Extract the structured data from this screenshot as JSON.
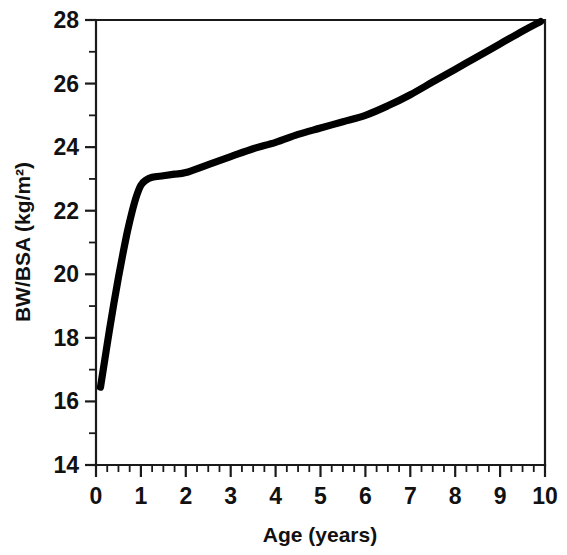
{
  "chart_data": {
    "type": "line",
    "title": "",
    "xlabel": "Age (years)",
    "ylabel": "BW/BSA (kg/m2)",
    "ylabel_display": "BW/BSA (kg/m²)",
    "xlim": [
      0,
      10
    ],
    "ylim": [
      14,
      28
    ],
    "xticks": [
      0,
      1,
      2,
      3,
      4,
      5,
      6,
      7,
      8,
      9,
      10
    ],
    "xtick_labels": [
      "0",
      "1",
      "2",
      "3",
      "4",
      "5",
      "6",
      "7",
      "8",
      "9",
      "10"
    ],
    "yticks": [
      14,
      16,
      18,
      20,
      22,
      24,
      26,
      28
    ],
    "ytick_labels": [
      "14",
      "16",
      "18",
      "20",
      "22",
      "24",
      "26",
      "28"
    ],
    "x_minor_interval": 0.25,
    "y_minor_interval": 1,
    "grid": false,
    "legend": false,
    "series": [
      {
        "name": "BW/BSA vs Age",
        "color": "#000000",
        "x": [
          0.1,
          0.2,
          0.3,
          0.4,
          0.5,
          0.6,
          0.7,
          0.8,
          0.9,
          1.0,
          1.1,
          1.25,
          1.5,
          1.75,
          2.0,
          2.5,
          3.0,
          3.5,
          4.0,
          4.5,
          5.0,
          5.5,
          6.0,
          6.5,
          7.0,
          7.5,
          8.0,
          8.5,
          9.0,
          9.5,
          9.9
        ],
        "y": [
          16.45,
          17.35,
          18.25,
          19.1,
          19.9,
          20.65,
          21.35,
          21.95,
          22.45,
          22.8,
          22.95,
          23.05,
          23.1,
          23.15,
          23.2,
          23.45,
          23.7,
          23.95,
          24.15,
          24.4,
          24.6,
          24.8,
          25.0,
          25.3,
          25.65,
          26.05,
          26.45,
          26.85,
          27.25,
          27.65,
          27.95
        ]
      }
    ]
  },
  "axes": {
    "x_title": "Age (years)",
    "y_title": "BW/BSA (kg/m²)"
  },
  "colors": {
    "curve": "#000000",
    "axis": "#1a1a1a",
    "background": "#ffffff"
  }
}
